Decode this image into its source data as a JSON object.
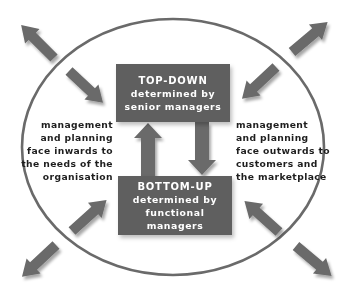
{
  "colors": {
    "box": "#5f5f5f",
    "arrow": "#6a6a6a",
    "ellipse": "#6a6a6a",
    "text": "#1e1e1e",
    "box_text": "#ffffff"
  },
  "top_box": {
    "title": "TOP-DOWN",
    "line1": "determined by",
    "line2": "senior managers"
  },
  "bottom_box": {
    "title": "BOTTOM-UP",
    "line1": "determined by",
    "line2": "functional managers"
  },
  "left_text": {
    "lines": [
      "management",
      "and planning",
      "face inwards to",
      "the needs of the",
      "organisation"
    ]
  },
  "right_text": {
    "lines": [
      "management",
      "and planning",
      "face outwards to",
      "customers and",
      "the marketplace"
    ]
  },
  "arrows": {
    "outer": [
      "arrow-top-left-outward",
      "arrow-top-right-outward",
      "arrow-bottom-left-outward",
      "arrow-bottom-right-outward"
    ],
    "inner": [
      "arrow-top-left-inward",
      "arrow-top-right-inward",
      "arrow-bottom-left-inward",
      "arrow-bottom-right-inward"
    ],
    "center": [
      "arrow-up-bottom-to-top",
      "arrow-down-top-to-bottom"
    ]
  }
}
